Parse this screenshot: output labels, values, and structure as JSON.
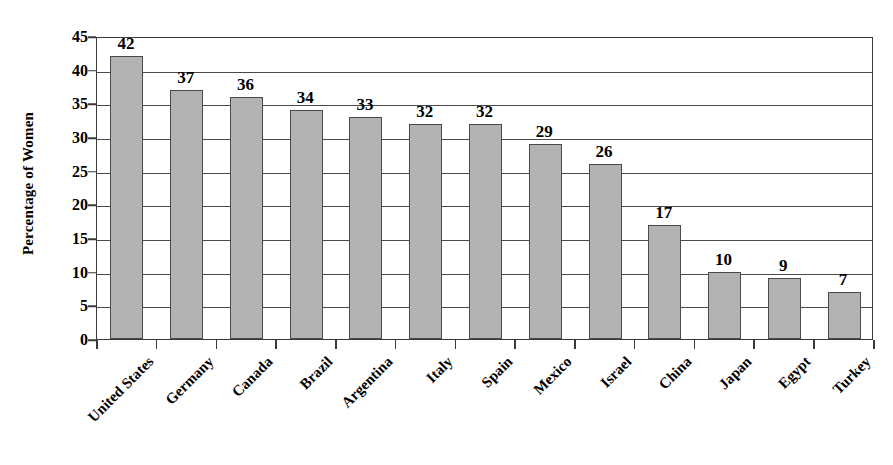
{
  "chart_data": {
    "type": "bar",
    "title": "",
    "subtitle": "",
    "xlabel": "",
    "ylabel": "Percentage of Women",
    "ylim": [
      0,
      45
    ],
    "yticks": [
      0,
      5,
      10,
      15,
      20,
      25,
      30,
      35,
      40,
      45
    ],
    "ytick_labels": [
      "0",
      "5",
      "10",
      "15",
      "20",
      "25",
      "30",
      "35",
      "40",
      "45"
    ],
    "grid": true,
    "legend": null,
    "legend_position": "none",
    "bar_fill_color": "#b3b3b3",
    "bar_border_color": "#4a4a4a",
    "axis_color": "#3a3a3a",
    "gridline_color": "#4a4a4a",
    "categories": [
      "United States",
      "Germany",
      "Canada",
      "Brazil",
      "Argentina",
      "Italy",
      "Spain",
      "Mexico",
      "Israel",
      "China",
      "Japan",
      "Egypt",
      "Turkey"
    ],
    "values": [
      42,
      37,
      36,
      34,
      33,
      32,
      32,
      29,
      26,
      17,
      10,
      9,
      7
    ],
    "data_labels": [
      "42",
      "37",
      "36",
      "34",
      "33",
      "32",
      "32",
      "29",
      "26",
      "17",
      "10",
      "9",
      "7"
    ]
  }
}
